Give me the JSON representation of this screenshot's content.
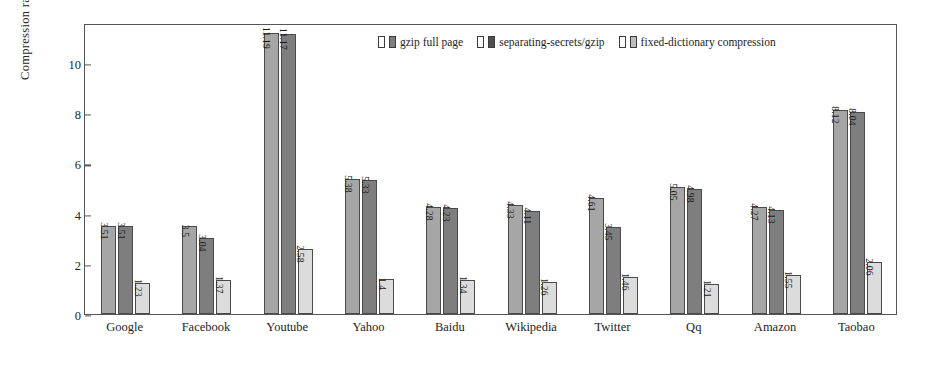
{
  "chart_data": {
    "type": "bar",
    "title": "",
    "xlabel": "",
    "ylabel": "Compression ratio",
    "ylim": [
      0,
      11.6
    ],
    "yticks": [
      0,
      2,
      4,
      6,
      8,
      10
    ],
    "grid": false,
    "legend_position": "top-center",
    "categories": [
      "Google",
      "Facebook",
      "Youtube",
      "Yahoo",
      "Baidu",
      "Wikipedia",
      "Twitter",
      "Qq",
      "Amazon",
      "Taobao"
    ],
    "series": [
      {
        "name": "gzip full page",
        "color": "#a6a6a6",
        "values": [
          3.51,
          3.5,
          11.19,
          5.38,
          4.28,
          4.33,
          4.61,
          5.05,
          4.27,
          8.12
        ],
        "labels": [
          "3.51",
          "3.5",
          "11.19",
          "5.38",
          "4.28",
          "4.33",
          "4.61",
          "5.05",
          "4.27",
          "8.12"
        ]
      },
      {
        "name": "separating-secrets/gzip",
        "color": "#7e7e7e",
        "values": [
          3.51,
          3.04,
          11.17,
          5.33,
          4.23,
          4.11,
          3.45,
          4.98,
          4.13,
          8.04
        ],
        "labels": [
          "3.51",
          "3.04",
          "11.17",
          "5.33",
          "4.23",
          "4.11",
          "3.45",
          "4.98",
          "4.13",
          "8.04"
        ]
      },
      {
        "name": "fixed-dictionary compression",
        "color": "#dcdcdc",
        "values": [
          1.23,
          1.37,
          2.58,
          1.4,
          1.34,
          1.26,
          1.46,
          1.21,
          1.55,
          2.06
        ],
        "labels": [
          "1.23",
          "1.37",
          "2.58",
          "1.4",
          "1.34",
          "1.26",
          "1.46",
          "1.21",
          "1.55",
          "2.06"
        ]
      }
    ]
  },
  "axis": {
    "y_title": "Compression ratio",
    "y_tick_labels": [
      "0",
      "2",
      "4",
      "6",
      "8",
      "10"
    ]
  },
  "legend": {
    "items": [
      {
        "label": "gzip full page"
      },
      {
        "label": "separating-secrets/gzip"
      },
      {
        "label": "fixed-dictionary compression"
      }
    ]
  }
}
